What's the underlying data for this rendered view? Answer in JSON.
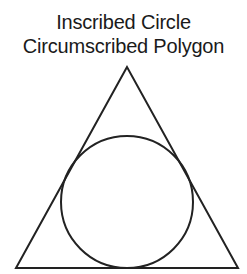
{
  "title": {
    "line1": "Inscribed Circle",
    "line2": "Circumscribed Polygon"
  },
  "figure": {
    "polygon": "triangle",
    "stroke_color": "#222222",
    "fill_color": "#ffffff"
  }
}
